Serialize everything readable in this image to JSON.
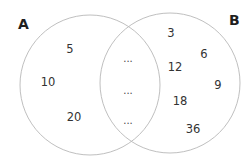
{
  "diagram": {
    "type": "venn",
    "sets": [
      {
        "label": "A",
        "only_elements": [
          "5",
          "10",
          "20"
        ]
      },
      {
        "label": "B",
        "only_elements": [
          "3",
          "6",
          "12",
          "9",
          "18",
          "36"
        ]
      }
    ],
    "intersection": [
      "...",
      "...",
      "..."
    ],
    "colors": {
      "circle_stroke": "#b8b8b8",
      "text": "#333333",
      "label": "#1f1f1f",
      "background": "#ffffff"
    }
  }
}
